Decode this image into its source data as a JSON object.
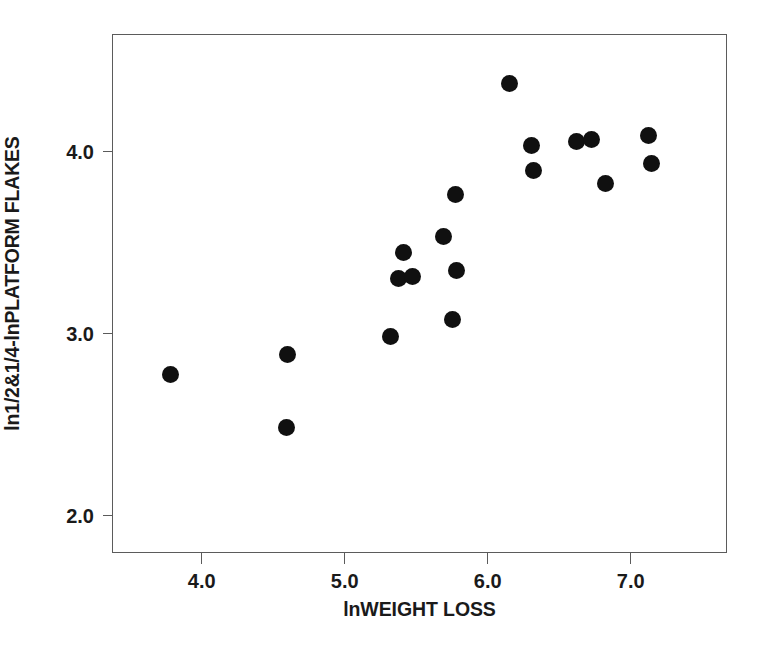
{
  "chart_data": {
    "type": "scatter",
    "title": "",
    "xlabel": "lnWEIGHT LOSS",
    "ylabel": "ln1/2&1/4-lnPLATFORM FLAKES",
    "xlim": [
      3.38,
      7.68
    ],
    "ylim": [
      1.79,
      4.64
    ],
    "xticks": [
      4.0,
      5.0,
      6.0,
      7.0
    ],
    "xtick_labels": [
      "4.0",
      "5.0",
      "6.0",
      "7.0"
    ],
    "yticks": [
      2.0,
      3.0,
      4.0
    ],
    "ytick_labels": [
      "2.0",
      "3.0",
      "4.0"
    ],
    "grid": false,
    "legend": null,
    "marker": "filled-circle",
    "marker_color": "#101010",
    "frame_color": "#5b5b5b",
    "n_points": 22,
    "points": [
      {
        "x": 3.79,
        "y": 2.77
      },
      {
        "x": 4.61,
        "y": 2.88
      },
      {
        "x": 4.6,
        "y": 2.48
      },
      {
        "x": 5.33,
        "y": 2.98
      },
      {
        "x": 5.42,
        "y": 3.44
      },
      {
        "x": 5.38,
        "y": 3.3
      },
      {
        "x": 5.48,
        "y": 3.31
      },
      {
        "x": 5.7,
        "y": 3.53
      },
      {
        "x": 5.78,
        "y": 3.76
      },
      {
        "x": 5.79,
        "y": 3.34
      },
      {
        "x": 5.76,
        "y": 3.07
      },
      {
        "x": 6.16,
        "y": 4.37
      },
      {
        "x": 6.31,
        "y": 4.03
      },
      {
        "x": 6.33,
        "y": 3.89
      },
      {
        "x": 6.63,
        "y": 4.05
      },
      {
        "x": 6.73,
        "y": 4.06
      },
      {
        "x": 6.83,
        "y": 3.82
      },
      {
        "x": 7.13,
        "y": 4.08
      },
      {
        "x": 7.15,
        "y": 3.93
      }
    ]
  },
  "axes": {
    "x": {
      "label": "lnWEIGHT LOSS",
      "ticks": [
        {
          "value": 4.0,
          "label": "4.0"
        },
        {
          "value": 5.0,
          "label": "5.0"
        },
        {
          "value": 6.0,
          "label": "6.0"
        },
        {
          "value": 7.0,
          "label": "7.0"
        }
      ]
    },
    "y": {
      "label": "ln1/2&1/4-lnPLATFORM FLAKES",
      "ticks": [
        {
          "value": 4.0,
          "label": "4.0"
        },
        {
          "value": 3.0,
          "label": "3.0"
        },
        {
          "value": 2.0,
          "label": "2.0"
        }
      ]
    }
  }
}
